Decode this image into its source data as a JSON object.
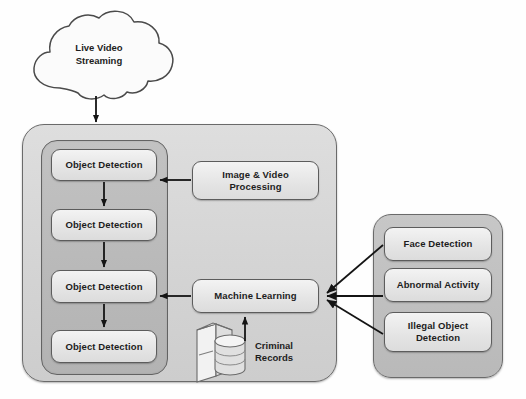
{
  "diagram": {
    "source": {
      "label": "Live Video\nStreaming",
      "line1": "Live Video",
      "line2": "Streaming",
      "icon": "cloud-icon"
    },
    "main_panel": {
      "name": "main-processing-panel",
      "detection_stack": {
        "name": "object-detection-stack",
        "boxes": [
          {
            "label": "Object Detection"
          },
          {
            "label": "Object Detection"
          },
          {
            "label": "Object Detection"
          },
          {
            "label": "Object Detection"
          }
        ]
      },
      "processing_box": {
        "line1": "Image & Video",
        "line2": "Processing"
      },
      "ml_box": {
        "label": "Machine Learning"
      },
      "datastore": {
        "icon": "database-icon",
        "line1": "Criminal",
        "line2": "Records"
      }
    },
    "analysis_panel": {
      "name": "analysis-modules-panel",
      "boxes": [
        {
          "line1": "Face Detection",
          "line2": ""
        },
        {
          "line1": "Abnormal Activity",
          "line2": ""
        },
        {
          "line1": "Illegal Object",
          "line2": "Detection"
        }
      ]
    },
    "colors": {
      "node_fill": "#e8e8e8",
      "node_border": "#5c5c5c",
      "panel_outer_fill": "#d6d6d6",
      "panel_inner_fill": "#bbbbbb",
      "arrow": "#1a1a1a",
      "background": "#ffffff"
    }
  }
}
